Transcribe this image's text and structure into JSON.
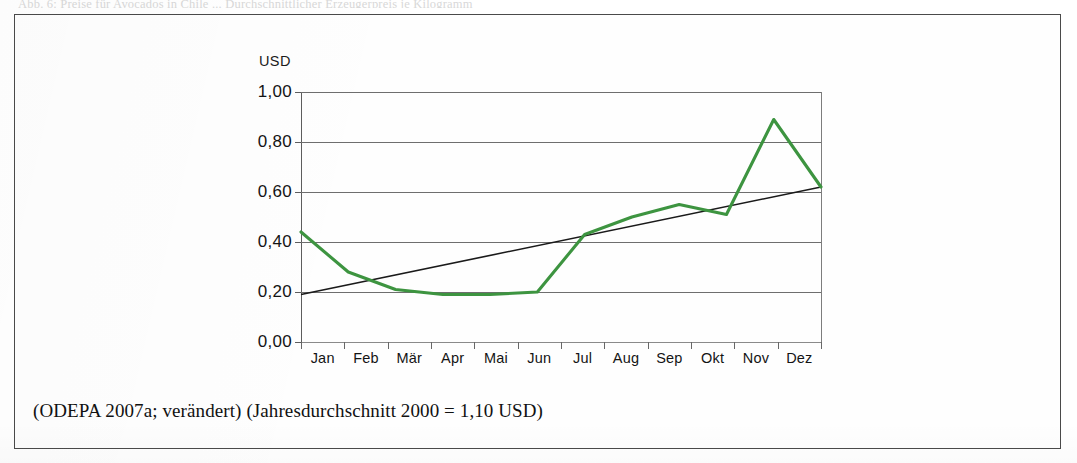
{
  "page": {
    "top_cut_text": "Abb. 6: Preise für Avocados in Chile ... Durchschnittlicher Erzeugerpreis je Kilogramm",
    "source_caption": "(ODEPA 2007a; verändert) (Jahresdurchschnitt 2000 = 1,10 USD)"
  },
  "chart_data": {
    "type": "line",
    "title": "",
    "subtitle": "",
    "xlabel": "",
    "ylabel": "USD",
    "axis_unit_label": "USD",
    "categories": [
      "Jan",
      "Feb",
      "Mär",
      "Apr",
      "Mai",
      "Jun",
      "Jul",
      "Aug",
      "Sep",
      "Okt",
      "Nov",
      "Dez"
    ],
    "ytick_labels": [
      "1,00",
      "0,80",
      "0,60",
      "0,40",
      "0,20",
      "0,00"
    ],
    "ytick_values": [
      1.0,
      0.8,
      0.6,
      0.4,
      0.2,
      0.0
    ],
    "ylim": [
      0.0,
      1.0
    ],
    "grid": true,
    "legend": "none",
    "series": [
      {
        "name": "Preis",
        "color": "#3d9440",
        "style": "line",
        "values": [
          0.44,
          0.28,
          0.21,
          0.19,
          0.19,
          0.2,
          0.43,
          0.5,
          0.55,
          0.51,
          0.89,
          0.62
        ]
      },
      {
        "name": "Trend",
        "color": "#1a1a1a",
        "style": "trendline",
        "values": [
          0.19,
          0.23,
          0.27,
          0.31,
          0.35,
          0.39,
          0.43,
          0.47,
          0.51,
          0.54,
          0.58,
          0.62
        ]
      }
    ],
    "annotations": {
      "max_point": {
        "category": "Nov",
        "value": 0.89
      },
      "min_point": {
        "category": "Apr",
        "value": 0.19
      }
    }
  }
}
